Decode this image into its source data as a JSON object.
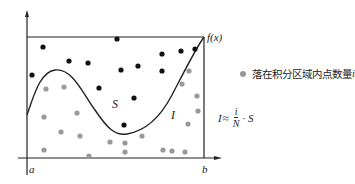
{
  "diagram": {
    "axes": {
      "x_start_label": "a",
      "x_end_label": "b"
    },
    "curve_label": "f(x)",
    "region_labels": {
      "above": "S",
      "integral": "I"
    },
    "legend": {
      "marker": "gray-dot",
      "text": "落在积分区域内点数量",
      "var": "i"
    },
    "formula": {
      "lhs": "I",
      "op": "≈",
      "num": "i",
      "den": "N",
      "rest": "· S"
    },
    "colors": {
      "outside_dot": "#111111",
      "inside_dot": "#999999",
      "line": "#222222"
    },
    "points_outside": [
      [
        43,
        47
      ],
      [
        69,
        61
      ],
      [
        88,
        63
      ],
      [
        117,
        39
      ],
      [
        32,
        75
      ],
      [
        121,
        70
      ],
      [
        138,
        66
      ],
      [
        162,
        54
      ],
      [
        162,
        71
      ],
      [
        181,
        51
      ],
      [
        195,
        49
      ],
      [
        99,
        88
      ],
      [
        134,
        98
      ],
      [
        124,
        125
      ]
    ],
    "points_inside": [
      [
        46,
        89
      ],
      [
        64,
        87
      ],
      [
        44,
        117
      ],
      [
        77,
        113
      ],
      [
        61,
        132
      ],
      [
        80,
        136
      ],
      [
        44,
        150
      ],
      [
        110,
        142
      ],
      [
        125,
        143
      ],
      [
        142,
        136
      ],
      [
        89,
        156
      ],
      [
        125,
        152
      ],
      [
        163,
        150
      ],
      [
        185,
        152
      ],
      [
        189,
        71
      ],
      [
        182,
        84
      ],
      [
        197,
        96
      ],
      [
        198,
        111
      ],
      [
        188,
        124
      ],
      [
        172,
        151
      ]
    ]
  }
}
